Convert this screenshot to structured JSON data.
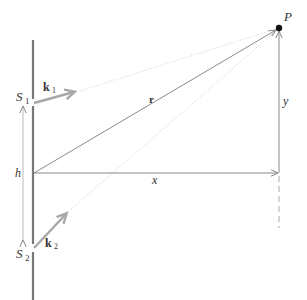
{
  "diagram": {
    "labels": {
      "point": "P",
      "slit1": "S",
      "slit1_sub": "1",
      "slit2": "S",
      "slit2_sub": "2",
      "wavevector1": "k",
      "wavevector1_sub": "1",
      "wavevector2": "k",
      "wavevector2_sub": "2",
      "position_vector": "r",
      "horizontal": "x",
      "vertical": "y",
      "separation": "h"
    },
    "colors": {
      "wall": "#777777",
      "wave_arrow": "#a8a8a8",
      "line": "#888888",
      "faint_line": "#dddddd",
      "point": "#111111"
    }
  }
}
